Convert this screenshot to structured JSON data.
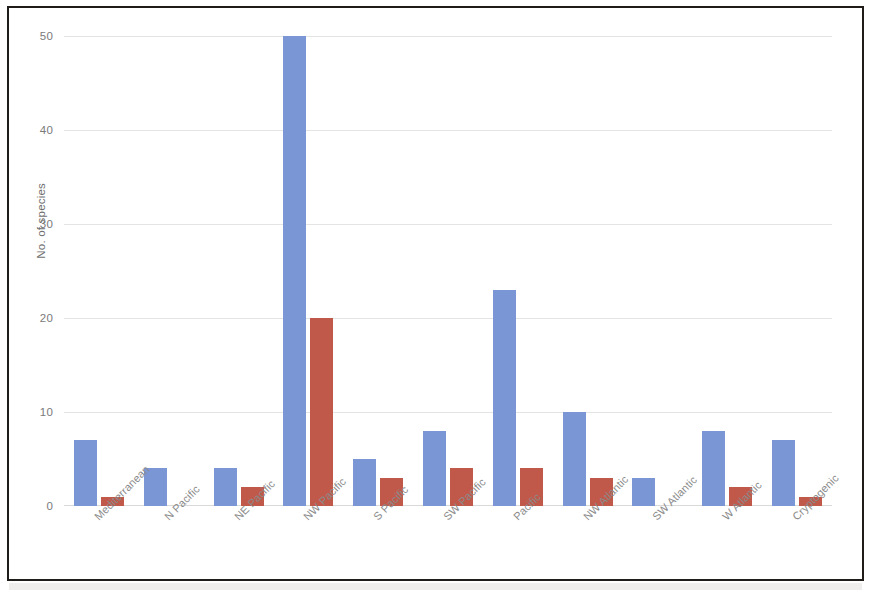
{
  "chart_data": {
    "type": "bar",
    "title": "",
    "xlabel": "",
    "ylabel": "No. of species",
    "ylim": [
      0,
      50
    ],
    "yticks": [
      0,
      10,
      20,
      30,
      40,
      50
    ],
    "grid": true,
    "legend": "none",
    "categories": [
      "Mediterranean",
      "N Pacific",
      "NE Pacific",
      "NW Pacific",
      "S Pacific",
      "SW Pacific",
      "Pacific",
      "NW Atlantic",
      "SW Atlantic",
      "W Atlantic",
      "Cryptogenic"
    ],
    "series": [
      {
        "name": "series-1",
        "color": "#7b96d4",
        "values": [
          7,
          4,
          4,
          50,
          5,
          8,
          23,
          10,
          3,
          8,
          7
        ]
      },
      {
        "name": "series-2",
        "color": "#c0594a",
        "values": [
          1,
          0,
          2,
          20,
          3,
          4,
          4,
          3,
          0,
          2,
          1
        ]
      }
    ]
  },
  "axis": {
    "y_title": "No. of species",
    "y_tick_labels": [
      "50",
      "40",
      "30",
      "20",
      "10",
      "0"
    ]
  },
  "colors": {
    "series_1": "#7b96d4",
    "series_2": "#c0594a",
    "gridline": "#e4e4e4",
    "frame_border": "#1f1c1a",
    "tick_text": "#7a7a7a",
    "background": "#ffffff"
  }
}
